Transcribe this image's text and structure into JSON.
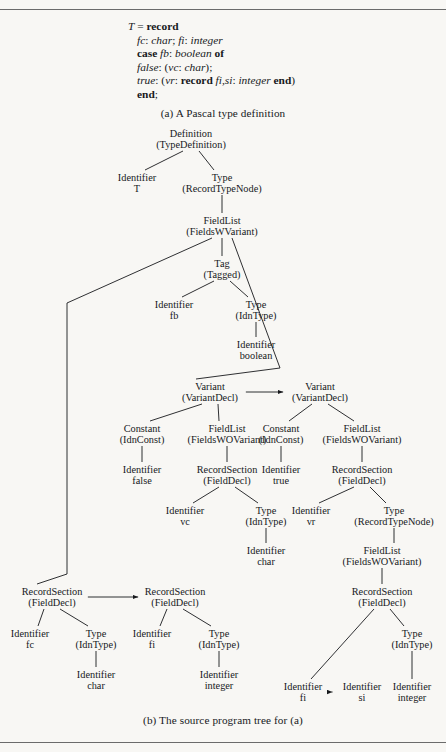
{
  "figure": {
    "caption_a": "(a) A Pascal type definition",
    "caption_b": "(b) The source program tree for (a)"
  },
  "code": {
    "lines": [
      {
        "id": "l1",
        "indent": false,
        "parts": [
          {
            "t": "T",
            "s": "i"
          },
          {
            "t": " = ",
            "s": "n"
          },
          {
            "t": "record",
            "s": "b"
          }
        ]
      },
      {
        "id": "l2",
        "indent": true,
        "parts": [
          {
            "t": "fc",
            "s": "i"
          },
          {
            "t": ": ",
            "s": "n"
          },
          {
            "t": "char",
            "s": "i"
          },
          {
            "t": "; ",
            "s": "n"
          },
          {
            "t": "fi",
            "s": "i"
          },
          {
            "t": ": ",
            "s": "n"
          },
          {
            "t": "integer",
            "s": "i"
          }
        ]
      },
      {
        "id": "l3",
        "indent": true,
        "parts": [
          {
            "t": "case",
            "s": "b"
          },
          {
            "t": " ",
            "s": "n"
          },
          {
            "t": "fb",
            "s": "i"
          },
          {
            "t": ": ",
            "s": "n"
          },
          {
            "t": "boolean",
            "s": "i"
          },
          {
            "t": " ",
            "s": "n"
          },
          {
            "t": "of",
            "s": "b"
          }
        ]
      },
      {
        "id": "l4",
        "indent": true,
        "parts": [
          {
            "t": "false",
            "s": "i"
          },
          {
            "t": ": (",
            "s": "n"
          },
          {
            "t": "vc",
            "s": "i"
          },
          {
            "t": ": ",
            "s": "n"
          },
          {
            "t": "char",
            "s": "i"
          },
          {
            "t": ");",
            "s": "n"
          }
        ]
      },
      {
        "id": "l5",
        "indent": true,
        "parts": [
          {
            "t": "true",
            "s": "i"
          },
          {
            "t": ": (",
            "s": "n"
          },
          {
            "t": "vr",
            "s": "i"
          },
          {
            "t": ": ",
            "s": "n"
          },
          {
            "t": "record",
            "s": "b"
          },
          {
            "t": " ",
            "s": "n"
          },
          {
            "t": "fi,si",
            "s": "i"
          },
          {
            "t": ": ",
            "s": "n"
          },
          {
            "t": "integer",
            "s": "i"
          },
          {
            "t": " ",
            "s": "n"
          },
          {
            "t": "end",
            "s": "b"
          },
          {
            "t": ")",
            "s": "n"
          }
        ]
      },
      {
        "id": "l6",
        "indent": true,
        "parts": [
          {
            "t": "end",
            "s": "b"
          },
          {
            "t": ";",
            "s": "n"
          }
        ]
      }
    ]
  },
  "tree": {
    "nodes": [
      {
        "id": "n01",
        "l1": "Definition",
        "l2": "(TypeDefinition)",
        "x": 191,
        "y": 128
      },
      {
        "id": "n02",
        "l1": "Identifier",
        "l2": "T",
        "x": 137,
        "y": 172
      },
      {
        "id": "n03",
        "l1": "Type",
        "l2": "(RecordTypeNode)",
        "x": 222,
        "y": 172
      },
      {
        "id": "n04",
        "l1": "FieldList",
        "l2": "(FieldsWVariant)",
        "x": 222,
        "y": 215
      },
      {
        "id": "n05",
        "l1": "Tag",
        "l2": "(Tagged)",
        "x": 222,
        "y": 258
      },
      {
        "id": "n06",
        "l1": "Identifier",
        "l2": "fb",
        "x": 174,
        "y": 299
      },
      {
        "id": "n07",
        "l1": "Type",
        "l2": "(IdnType)",
        "x": 256,
        "y": 299
      },
      {
        "id": "n08",
        "l1": "Identifier",
        "l2": "boolean",
        "x": 256,
        "y": 339
      },
      {
        "id": "n09",
        "l1": "Variant",
        "l2": "(VariantDecl)",
        "x": 210,
        "y": 381
      },
      {
        "id": "n10",
        "l1": "Variant",
        "l2": "(VariantDecl)",
        "x": 320,
        "y": 381
      },
      {
        "id": "n11",
        "l1": "Constant",
        "l2": "(IdnConst)",
        "x": 142,
        "y": 423
      },
      {
        "id": "n12",
        "l1": "FieldList",
        "l2": "(FieldsWOVariant)",
        "x": 227,
        "y": 423
      },
      {
        "id": "n13",
        "l1": "Constant",
        "l2": "(IdnConst)",
        "x": 281,
        "y": 423
      },
      {
        "id": "n14",
        "l1": "FieldList",
        "l2": "(FieldsWOVariant)",
        "x": 362,
        "y": 423
      },
      {
        "id": "n15",
        "l1": "Identifier",
        "l2": "false",
        "x": 142,
        "y": 464
      },
      {
        "id": "n16",
        "l1": "RecordSection",
        "l2": "(FieldDecl)",
        "x": 227,
        "y": 464
      },
      {
        "id": "n17",
        "l1": "Identifier",
        "l2": "true",
        "x": 281,
        "y": 464
      },
      {
        "id": "n18",
        "l1": "RecordSection",
        "l2": "(FieldDecl)",
        "x": 362,
        "y": 464
      },
      {
        "id": "n19",
        "l1": "Identifier",
        "l2": "vc",
        "x": 185,
        "y": 505
      },
      {
        "id": "n20",
        "l1": "Type",
        "l2": "(IdnType)",
        "x": 266,
        "y": 505
      },
      {
        "id": "n21",
        "l1": "Identifier",
        "l2": "vr",
        "x": 311,
        "y": 505
      },
      {
        "id": "n22",
        "l1": "Type",
        "l2": "(RecordTypeNode)",
        "x": 394,
        "y": 505
      },
      {
        "id": "n23",
        "l1": "Identifier",
        "l2": "char",
        "x": 266,
        "y": 545
      },
      {
        "id": "n24",
        "l1": "FieldList",
        "l2": "(FieldsWOVariant)",
        "x": 382,
        "y": 545
      },
      {
        "id": "n25",
        "l1": "RecordSection",
        "l2": "(FieldDecl)",
        "x": 382,
        "y": 586
      },
      {
        "id": "n26",
        "l1": "RecordSection",
        "l2": "(FieldDecl)",
        "x": 52,
        "y": 586
      },
      {
        "id": "n27",
        "l1": "RecordSection",
        "l2": "(FieldDecl)",
        "x": 175,
        "y": 586
      },
      {
        "id": "n28",
        "l1": "Identifier",
        "l2": "fc",
        "x": 30,
        "y": 628
      },
      {
        "id": "n29",
        "l1": "Type",
        "l2": "(IdnType)",
        "x": 96,
        "y": 628
      },
      {
        "id": "n30",
        "l1": "Identifier",
        "l2": "fi",
        "x": 152,
        "y": 628
      },
      {
        "id": "n31",
        "l1": "Type",
        "l2": "(IdnType)",
        "x": 219,
        "y": 628
      },
      {
        "id": "n32",
        "l1": "Type",
        "l2": "(IdnType)",
        "x": 412,
        "y": 628
      },
      {
        "id": "n33",
        "l1": "Identifier",
        "l2": "char",
        "x": 96,
        "y": 669
      },
      {
        "id": "n34",
        "l1": "Identifier",
        "l2": "integer",
        "x": 219,
        "y": 669
      },
      {
        "id": "n35",
        "l1": "Identifier",
        "l2": "fi",
        "x": 303,
        "y": 681
      },
      {
        "id": "n36",
        "l1": "Identifier",
        "l2": "si",
        "x": 362,
        "y": 681
      },
      {
        "id": "n37",
        "l1": "Identifier",
        "l2": "integer",
        "x": 412,
        "y": 681
      }
    ],
    "edges": [
      {
        "from": "n01",
        "to": "n02",
        "kind": "line"
      },
      {
        "from": "n01",
        "to": "n03",
        "kind": "line"
      },
      {
        "from": "n03",
        "to": "n04",
        "kind": "vertical"
      },
      {
        "from": "n04",
        "to": "n05",
        "kind": "vertical"
      },
      {
        "from": "n05",
        "to": "n06",
        "kind": "line"
      },
      {
        "from": "n05",
        "to": "n07",
        "kind": "line"
      },
      {
        "from": "n07",
        "to": "n08",
        "kind": "vertical"
      },
      {
        "from": "n04",
        "to": "n26",
        "kind": "elbow-left"
      },
      {
        "from": "n04",
        "to": "n09",
        "kind": "elbow-right"
      },
      {
        "from": "n09",
        "to": "n10",
        "kind": "arrow"
      },
      {
        "from": "n09",
        "to": "n11",
        "kind": "line"
      },
      {
        "from": "n09",
        "to": "n12",
        "kind": "line"
      },
      {
        "from": "n10",
        "to": "n13",
        "kind": "line"
      },
      {
        "from": "n10",
        "to": "n14",
        "kind": "line"
      },
      {
        "from": "n11",
        "to": "n15",
        "kind": "vertical"
      },
      {
        "from": "n12",
        "to": "n16",
        "kind": "vertical"
      },
      {
        "from": "n13",
        "to": "n17",
        "kind": "vertical"
      },
      {
        "from": "n14",
        "to": "n18",
        "kind": "vertical"
      },
      {
        "from": "n16",
        "to": "n19",
        "kind": "line"
      },
      {
        "from": "n16",
        "to": "n20",
        "kind": "line"
      },
      {
        "from": "n18",
        "to": "n21",
        "kind": "line"
      },
      {
        "from": "n18",
        "to": "n22",
        "kind": "line"
      },
      {
        "from": "n20",
        "to": "n23",
        "kind": "vertical"
      },
      {
        "from": "n22",
        "to": "n24",
        "kind": "vertical"
      },
      {
        "from": "n24",
        "to": "n25",
        "kind": "vertical"
      },
      {
        "from": "n26",
        "to": "n27",
        "kind": "arrow"
      },
      {
        "from": "n26",
        "to": "n28",
        "kind": "line"
      },
      {
        "from": "n26",
        "to": "n29",
        "kind": "line"
      },
      {
        "from": "n27",
        "to": "n30",
        "kind": "line"
      },
      {
        "from": "n27",
        "to": "n31",
        "kind": "line"
      },
      {
        "from": "n29",
        "to": "n33",
        "kind": "vertical"
      },
      {
        "from": "n31",
        "to": "n34",
        "kind": "vertical"
      },
      {
        "from": "n25",
        "to": "n35",
        "kind": "line"
      },
      {
        "from": "n25",
        "to": "n32",
        "kind": "line"
      },
      {
        "from": "n32",
        "to": "n37",
        "kind": "vertical"
      },
      {
        "from": "n35",
        "to": "n36",
        "kind": "arrow"
      }
    ]
  },
  "colors": {
    "ink": "#17191c",
    "paper": "#f8f7f4",
    "rule": "#6b6b6b"
  }
}
